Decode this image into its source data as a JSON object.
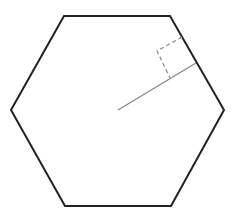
{
  "diagram": {
    "hexagon": {
      "points": "64,16 170,16 224,110 171,206 65,206 11,110",
      "stroke": "#222222",
      "stroke_width": 2
    },
    "apothem": {
      "x1": 118,
      "y1": 110,
      "x2": 196,
      "y2": 63,
      "stroke": "#888888"
    },
    "right_angle_marker": {
      "points": "182,37 157,51 170,78",
      "stroke": "#888888"
    }
  }
}
